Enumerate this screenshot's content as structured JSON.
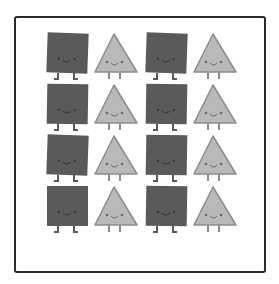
{
  "figure": {
    "rows": 4,
    "columns": 4,
    "pattern": [
      "square",
      "triangle",
      "square",
      "triangle"
    ],
    "colors": {
      "square_fill": "#5a5a5a",
      "square_face": "#3a3a3a",
      "triangle_fill": "#b9b9b9",
      "triangle_stroke": "#8c8c8c",
      "triangle_face": "#6a6a6a",
      "legs": "#5a5a5a",
      "frame": "#2a2a2a"
    },
    "column_x": [
      46,
      94,
      145,
      193
    ],
    "row_y": [
      33,
      84,
      135,
      186
    ],
    "cells": [
      [
        {
          "shape": "square",
          "tilt": 2
        },
        {
          "shape": "triangle",
          "tilt": 0
        },
        {
          "shape": "square",
          "tilt": 2
        },
        {
          "shape": "triangle",
          "tilt": 0
        }
      ],
      [
        {
          "shape": "square",
          "tilt": 1
        },
        {
          "shape": "triangle",
          "tilt": 0
        },
        {
          "shape": "square",
          "tilt": 1
        },
        {
          "shape": "triangle",
          "tilt": 0
        }
      ],
      [
        {
          "shape": "square",
          "tilt": 2
        },
        {
          "shape": "triangle",
          "tilt": 0
        },
        {
          "shape": "square",
          "tilt": 1
        },
        {
          "shape": "triangle",
          "tilt": 0
        }
      ],
      [
        {
          "shape": "square",
          "tilt": 0
        },
        {
          "shape": "triangle",
          "tilt": 0
        },
        {
          "shape": "square",
          "tilt": 1
        },
        {
          "shape": "triangle",
          "tilt": 0
        }
      ]
    ]
  }
}
